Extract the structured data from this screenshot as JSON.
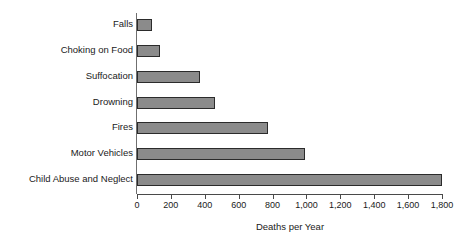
{
  "chart_data": {
    "type": "bar",
    "orientation": "horizontal",
    "title": "",
    "xlabel": "Deaths per Year",
    "ylabel": "",
    "categories": [
      "Falls",
      "Choking on Food",
      "Suffocation",
      "Drowning",
      "Fires",
      "Motor Vehicles",
      "Child Abuse and Neglect"
    ],
    "values": [
      90,
      135,
      370,
      460,
      775,
      990,
      1800
    ],
    "xlim": [
      0,
      1800
    ],
    "xticks": [
      0,
      200,
      400,
      600,
      800,
      1000,
      1200,
      1400,
      1600,
      1800
    ],
    "xtick_labels": [
      "0",
      "200",
      "400",
      "600",
      "800",
      "1,000",
      "1,200",
      "1,400",
      "1,600",
      "1,800"
    ],
    "grid": false,
    "legend": null,
    "bar_fill_color": "#8b8b8b",
    "bar_border_color": "#2b2b2b",
    "axis_color": "#4a4a4a",
    "background_color": "#ffffff"
  }
}
